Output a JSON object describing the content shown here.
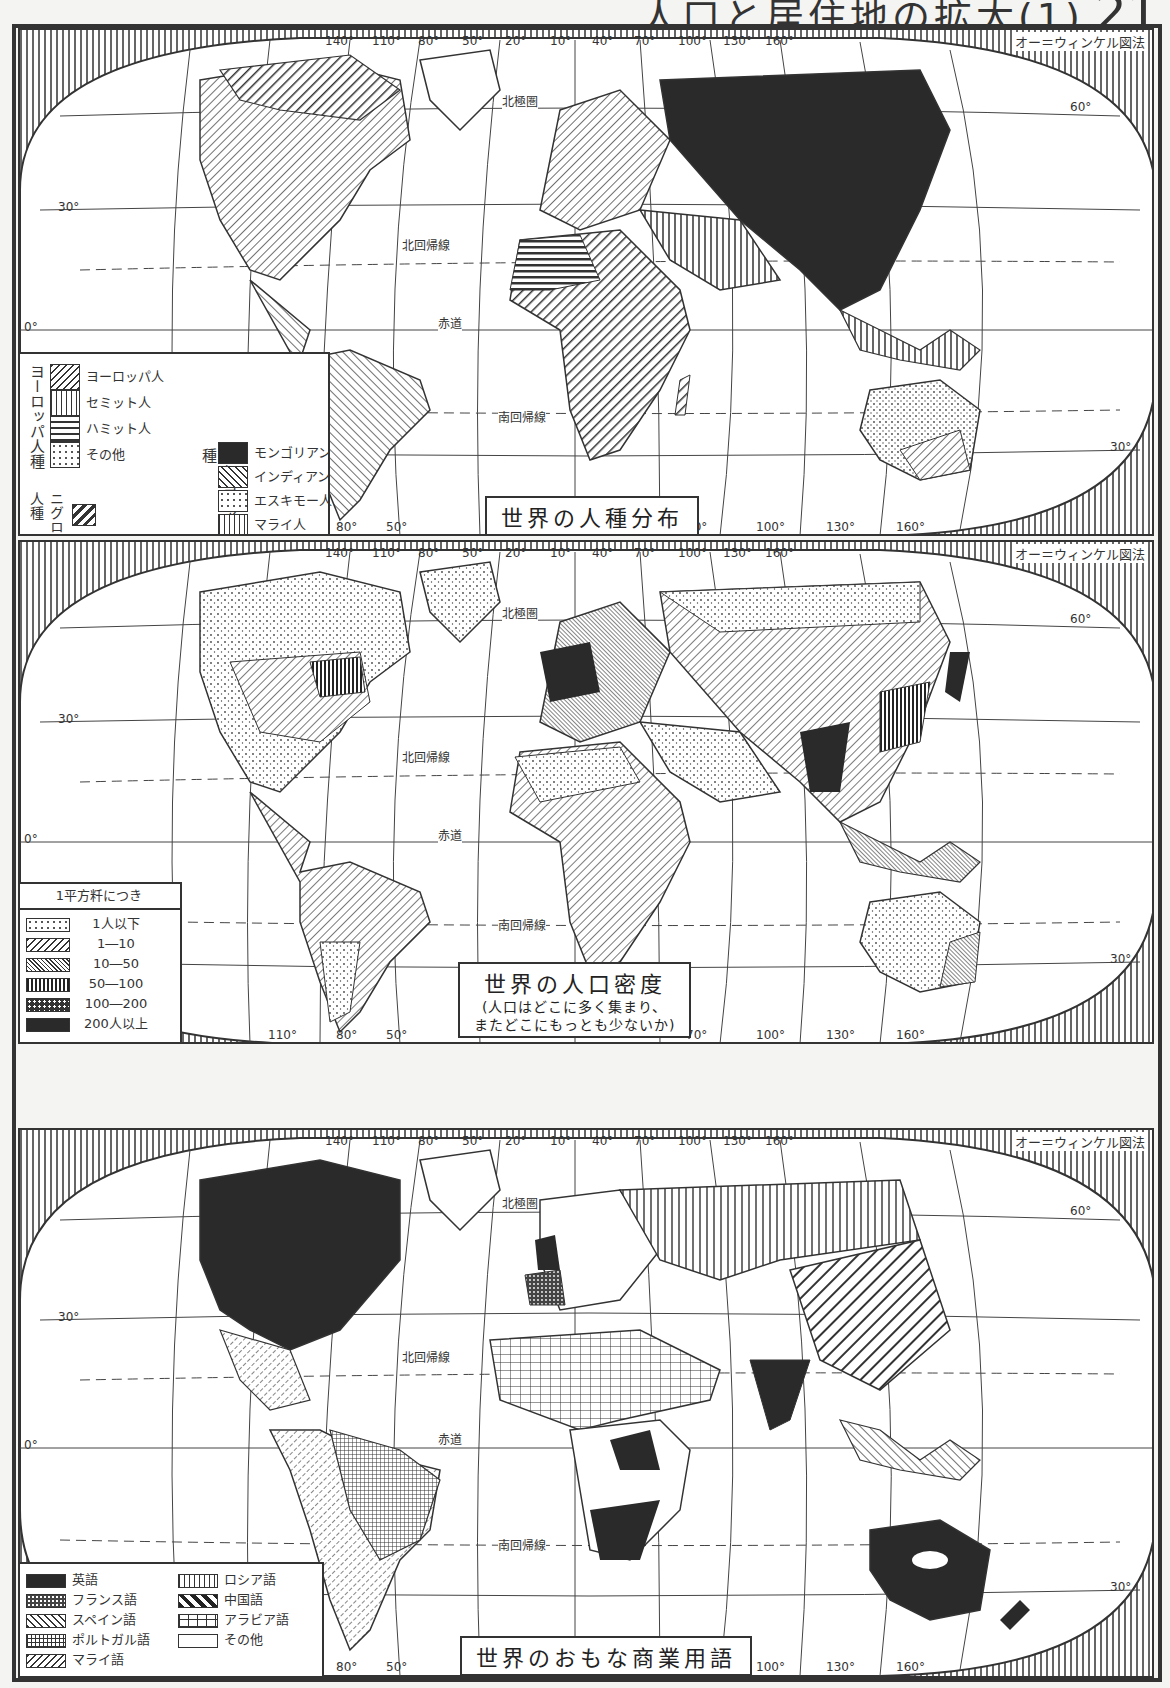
{
  "page": {
    "title": "人口と居住地の拡大(1)",
    "number": "21"
  },
  "projection_label": "オー＝ウィンケル図法",
  "grid_labels": {
    "top_longitudes": [
      "140°",
      "110°",
      "80°",
      "50°",
      "20°",
      "10°",
      "40°",
      "70°",
      "100°",
      "130°",
      "160°"
    ],
    "bottom_longitudes": [
      "80°",
      "50°",
      "70°",
      "100°",
      "130°",
      "160°"
    ],
    "bottom_longitudes_map2": [
      "110°",
      "80°",
      "50°",
      "70°",
      "100°",
      "130°",
      "160°"
    ],
    "latitudes": [
      "60°",
      "30°",
      "0°",
      "30°"
    ],
    "arctic_circle": "北極圏",
    "tropic_cancer": "北回帰線",
    "equator": "赤道",
    "tropic_capricorn": "南回帰線"
  },
  "maps": [
    {
      "title": "世界の人種分布",
      "legend": {
        "groups": [
          {
            "group_label": "ヨーロッパ人種",
            "items": [
              {
                "label": "ヨーロッパ人",
                "pattern": "diagonal-hatch"
              },
              {
                "label": "セミット人",
                "pattern": "vertical-lines"
              },
              {
                "label": "ハミット人",
                "pattern": "horizontal-bars"
              },
              {
                "label": "その他",
                "pattern": "scattered-dots"
              }
            ]
          },
          {
            "group_label": "ニグロ人種",
            "items": [
              {
                "label": "",
                "pattern": "thick-diagonal-hatch"
              }
            ]
          },
          {
            "group_label": "モンゴリア人種",
            "items": [
              {
                "label": "モンゴリアン",
                "pattern": "solid-black"
              },
              {
                "label": "インディアン",
                "pattern": "reverse-diagonal-hatch"
              },
              {
                "label": "エスキモー人",
                "pattern": "dots"
              },
              {
                "label": "マライ人",
                "pattern": "vertical-lines"
              }
            ]
          }
        ]
      }
    },
    {
      "title": "世界の人口密度",
      "subtitle_line1": "(人口はどこに多く集まり、",
      "subtitle_line2": "またどこにもっとも少ないか)",
      "legend": {
        "heading": "1平方粁につき",
        "items": [
          {
            "label": "1人以下",
            "pattern": "dots"
          },
          {
            "label": "1―10",
            "pattern": "diagonal-hatch"
          },
          {
            "label": "10―50",
            "pattern": "dense-diagonal"
          },
          {
            "label": "50―100",
            "pattern": "vertical-lines"
          },
          {
            "label": "100―200",
            "pattern": "dark-dotted"
          },
          {
            "label": "200人以上",
            "pattern": "solid-black"
          }
        ]
      }
    },
    {
      "title": "世界のおもな商業用語",
      "legend": {
        "items": [
          {
            "label": "英語",
            "pattern": "solid-black"
          },
          {
            "label": "フランス語",
            "pattern": "dark-scribble"
          },
          {
            "label": "スペイン語",
            "pattern": "dashed-diagonal"
          },
          {
            "label": "ポルトガル語",
            "pattern": "grid"
          },
          {
            "label": "マライ語",
            "pattern": "reverse-diagonal-hatch"
          },
          {
            "label": "ロシア語",
            "pattern": "vertical-lines"
          },
          {
            "label": "中国語",
            "pattern": "thick-diagonal-hatch"
          },
          {
            "label": "アラビア語",
            "pattern": "brick"
          },
          {
            "label": "その他",
            "pattern": "blank"
          }
        ]
      }
    }
  ],
  "colors": {
    "ink": "#2a2a2a",
    "paper": "#ffffff",
    "background": "#f4f4f2"
  }
}
